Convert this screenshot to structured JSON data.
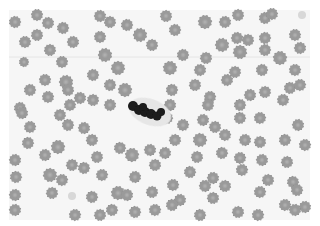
{
  "image": {
    "subject": "Peripheral blood smear micrograph (grayscale) with crenated red blood cells and a central dark-stained leukocyte",
    "width": 320,
    "height": 226,
    "frame": {
      "x": 9,
      "y": 10,
      "w": 301,
      "h": 210
    },
    "colors": {
      "background": "#ffffff",
      "field": "#f6f6f6",
      "cell_fill": "#9a9a9a",
      "cell_center": "#b4b4b4",
      "cell_edge": "#858585",
      "nucleus": "#1a1a1a",
      "halo": "#e6e6e6",
      "scan_line": "#e2e2e2"
    },
    "scan_line_y": 57,
    "cells": [
      [
        15,
        22,
        6
      ],
      [
        37,
        15,
        6
      ],
      [
        48,
        23,
        6
      ],
      [
        37,
        35,
        6
      ],
      [
        63,
        28,
        6
      ],
      [
        25,
        42,
        6
      ],
      [
        73,
        42,
        6
      ],
      [
        50,
        50,
        6
      ],
      [
        24,
        62,
        5
      ],
      [
        62,
        62,
        6
      ],
      [
        100,
        16,
        6
      ],
      [
        110,
        22,
        6
      ],
      [
        127,
        25,
        6
      ],
      [
        100,
        37,
        6
      ],
      [
        105,
        55,
        7
      ],
      [
        118,
        68,
        7
      ],
      [
        93,
        75,
        6
      ],
      [
        45,
        80,
        6
      ],
      [
        66,
        82,
        7
      ],
      [
        68,
        90,
        6
      ],
      [
        30,
        90,
        6
      ],
      [
        48,
        97,
        6
      ],
      [
        80,
        98,
        6
      ],
      [
        93,
        100,
        6
      ],
      [
        110,
        85,
        6
      ],
      [
        125,
        90,
        7
      ],
      [
        140,
        35,
        7
      ],
      [
        152,
        45,
        6
      ],
      [
        20,
        108,
        6
      ],
      [
        70,
        105,
        6
      ],
      [
        110,
        105,
        6
      ],
      [
        166,
        16,
        6
      ],
      [
        175,
        30,
        6
      ],
      [
        205,
        22,
        7
      ],
      [
        225,
        22,
        6
      ],
      [
        238,
        15,
        6
      ],
      [
        265,
        18,
        6
      ],
      [
        272,
        14,
        6
      ],
      [
        237,
        38,
        6
      ],
      [
        248,
        40,
        6
      ],
      [
        265,
        38,
        6
      ],
      [
        295,
        35,
        6
      ],
      [
        222,
        45,
        7
      ],
      [
        240,
        52,
        7
      ],
      [
        265,
        50,
        6
      ],
      [
        280,
        58,
        7
      ],
      [
        300,
        48,
        6
      ],
      [
        206,
        58,
        6
      ],
      [
        183,
        55,
        6
      ],
      [
        170,
        68,
        7
      ],
      [
        200,
        70,
        6
      ],
      [
        235,
        72,
        6
      ],
      [
        262,
        70,
        6
      ],
      [
        295,
        70,
        6
      ],
      [
        227,
        80,
        6
      ],
      [
        195,
        85,
        6
      ],
      [
        172,
        90,
        6
      ],
      [
        210,
        97,
        6
      ],
      [
        250,
        95,
        6
      ],
      [
        265,
        92,
        6
      ],
      [
        290,
        88,
        6
      ],
      [
        300,
        85,
        6
      ],
      [
        170,
        105,
        6
      ],
      [
        208,
        105,
        6
      ],
      [
        240,
        105,
        6
      ],
      [
        283,
        100,
        6
      ],
      [
        22,
        113,
        6
      ],
      [
        60,
        115,
        6
      ],
      [
        68,
        125,
        6
      ],
      [
        30,
        127,
        6
      ],
      [
        84,
        128,
        6
      ],
      [
        92,
        140,
        6
      ],
      [
        28,
        143,
        6
      ],
      [
        58,
        147,
        7
      ],
      [
        45,
        155,
        6
      ],
      [
        97,
        157,
        6
      ],
      [
        120,
        148,
        6
      ],
      [
        132,
        155,
        7
      ],
      [
        15,
        160,
        6
      ],
      [
        72,
        165,
        6
      ],
      [
        84,
        168,
        6
      ],
      [
        102,
        175,
        6
      ],
      [
        135,
        177,
        6
      ],
      [
        50,
        175,
        7
      ],
      [
        16,
        177,
        6
      ],
      [
        62,
        180,
        6
      ],
      [
        15,
        195,
        6
      ],
      [
        52,
        193,
        6
      ],
      [
        92,
        197,
        6
      ],
      [
        118,
        193,
        7
      ],
      [
        127,
        195,
        6
      ],
      [
        152,
        192,
        6
      ],
      [
        112,
        210,
        6
      ],
      [
        75,
        215,
        6
      ],
      [
        15,
        210,
        6
      ],
      [
        100,
        215,
        6
      ],
      [
        135,
        212,
        6
      ],
      [
        155,
        210,
        6
      ],
      [
        150,
        150,
        6
      ],
      [
        155,
        165,
        6
      ],
      [
        167,
        118,
        6
      ],
      [
        183,
        125,
        6
      ],
      [
        203,
        120,
        6
      ],
      [
        215,
        127,
        6
      ],
      [
        240,
        118,
        6
      ],
      [
        260,
        118,
        6
      ],
      [
        298,
        125,
        6
      ],
      [
        175,
        140,
        6
      ],
      [
        200,
        140,
        7
      ],
      [
        225,
        135,
        6
      ],
      [
        245,
        140,
        6
      ],
      [
        260,
        142,
        6
      ],
      [
        285,
        140,
        6
      ],
      [
        305,
        145,
        6
      ],
      [
        165,
        153,
        6
      ],
      [
        197,
        157,
        6
      ],
      [
        222,
        153,
        6
      ],
      [
        240,
        158,
        6
      ],
      [
        262,
        160,
        6
      ],
      [
        287,
        162,
        6
      ],
      [
        190,
        172,
        6
      ],
      [
        242,
        170,
        6
      ],
      [
        213,
        178,
        6
      ],
      [
        268,
        180,
        6
      ],
      [
        293,
        182,
        6
      ],
      [
        173,
        185,
        6
      ],
      [
        205,
        186,
        6
      ],
      [
        225,
        186,
        6
      ],
      [
        297,
        190,
        6
      ],
      [
        260,
        192,
        6
      ],
      [
        180,
        200,
        6
      ],
      [
        213,
        198,
        6
      ],
      [
        172,
        205,
        6
      ],
      [
        285,
        205,
        6
      ],
      [
        305,
        207,
        6
      ],
      [
        238,
        212,
        6
      ],
      [
        200,
        215,
        6
      ],
      [
        258,
        215,
        6
      ],
      [
        295,
        210,
        6
      ]
    ],
    "faint_cells": [
      [
        302,
        15,
        4
      ],
      [
        72,
        196,
        4
      ]
    ],
    "leukocyte": {
      "halo": {
        "cx": 150,
        "cy": 112,
        "rx": 22,
        "ry": 13,
        "rotate": 20
      },
      "nucleus_lobes": [
        [
          133,
          106,
          5
        ],
        [
          139,
          110,
          5
        ],
        [
          145,
          112,
          5
        ],
        [
          151,
          114,
          5
        ],
        [
          157,
          116,
          4.5
        ],
        [
          161,
          112,
          4
        ],
        [
          143,
          107,
          4
        ]
      ]
    }
  }
}
